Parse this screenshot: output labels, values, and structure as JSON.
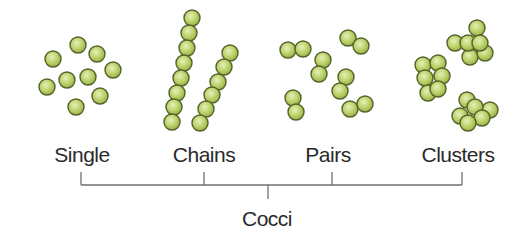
{
  "diagram": {
    "title": "Cocci",
    "colors": {
      "coccus_fill_light": "#e6efbd",
      "coccus_fill_mid": "#bcd36a",
      "coccus_fill_dark": "#95ae45",
      "coccus_outline": "#55632a",
      "line": "#707070",
      "text": "#2a2a2a"
    },
    "groups": [
      {
        "label": "Single",
        "label_x": 82,
        "tick_x": 81,
        "cells": [
          [
            78,
            45
          ],
          [
            97,
            54
          ],
          [
            53,
            59
          ],
          [
            113,
            70
          ],
          [
            88,
            77
          ],
          [
            67,
            80
          ],
          [
            47,
            87
          ],
          [
            100,
            96
          ],
          [
            76,
            107
          ]
        ]
      },
      {
        "label": "Chains",
        "label_x": 204,
        "tick_x": 204,
        "cells": [
          [
            192,
            18
          ],
          [
            189,
            33
          ],
          [
            187,
            48
          ],
          [
            184,
            63
          ],
          [
            181,
            78
          ],
          [
            177,
            93
          ],
          [
            174,
            107
          ],
          [
            172,
            122
          ],
          [
            230,
            53
          ],
          [
            224,
            67
          ],
          [
            218,
            82
          ],
          [
            212,
            95
          ],
          [
            206,
            109
          ],
          [
            200,
            123
          ]
        ]
      },
      {
        "label": "Pairs",
        "label_x": 328,
        "tick_x": 332,
        "cells": [
          [
            288,
            50
          ],
          [
            303,
            49
          ],
          [
            348,
            38
          ],
          [
            361,
            46
          ],
          [
            323,
            60
          ],
          [
            319,
            74
          ],
          [
            346,
            77
          ],
          [
            340,
            91
          ],
          [
            293,
            98
          ],
          [
            296,
            112
          ],
          [
            350,
            109
          ],
          [
            365,
            104
          ]
        ]
      },
      {
        "label": "Clusters",
        "label_x": 458,
        "tick_x": 462,
        "cells": [
          [
            455,
            43
          ],
          [
            477,
            28
          ],
          [
            470,
            57
          ],
          [
            485,
            53
          ],
          [
            468,
            43
          ],
          [
            480,
            43
          ],
          [
            423,
            65
          ],
          [
            438,
            63
          ],
          [
            425,
            78
          ],
          [
            442,
            76
          ],
          [
            428,
            93
          ],
          [
            438,
            89
          ],
          [
            467,
            100
          ],
          [
            490,
            110
          ],
          [
            460,
            116
          ],
          [
            475,
            107
          ],
          [
            482,
            118
          ],
          [
            468,
            123
          ]
        ]
      }
    ],
    "bracket": {
      "y": 185,
      "tick_top": 172,
      "stem_x": 268,
      "stem_bottom": 199
    },
    "title_x": 267,
    "title_y": 226,
    "label_y": 162,
    "cell_radius": 8
  }
}
